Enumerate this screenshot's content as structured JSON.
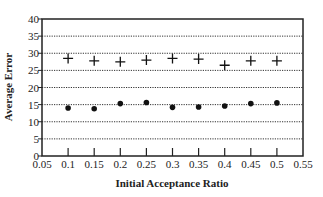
{
  "chart_data": {
    "type": "scatter",
    "title": "",
    "xlabel": "Initial Acceptance Ratio",
    "ylabel": "Average Error",
    "xlim": [
      0.05,
      0.55
    ],
    "ylim": [
      0,
      40
    ],
    "x_ticks": [
      "0.05",
      "0.1",
      "0.15",
      "0.2",
      "0.25",
      "0.3",
      "0.35",
      "0.4",
      "0.45",
      "0.5",
      "0.55"
    ],
    "y_ticks": [
      "0",
      "5",
      "10",
      "15",
      "20",
      "25",
      "30",
      "35",
      "40"
    ],
    "grid": "horizontal dotted",
    "legend": "none",
    "x": [
      0.1,
      0.15,
      0.2,
      0.25,
      0.3,
      0.35,
      0.4,
      0.45,
      0.5
    ],
    "series": [
      {
        "name": "plus",
        "marker": "+",
        "values": [
          28.5,
          27.8,
          27.5,
          28.0,
          28.5,
          28.3,
          26.5,
          27.8,
          27.8
        ]
      },
      {
        "name": "dot",
        "marker": "circle",
        "values": [
          14.0,
          13.8,
          15.3,
          15.6,
          14.2,
          14.3,
          14.6,
          15.3,
          15.5
        ]
      }
    ]
  }
}
